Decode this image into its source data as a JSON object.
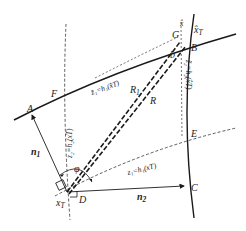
{
  "diagram": {
    "type": "geometric-positioning-diagram",
    "points": {
      "A": "A",
      "B": "B",
      "C": "C",
      "D": "D",
      "E": "E",
      "F": "F",
      "G": "G"
    },
    "vectors": {
      "n1": "n",
      "n1_sub": "1",
      "n2": "n",
      "n2_sub": "2"
    },
    "lengths": {
      "R1": "R",
      "R1_sub": "1",
      "R": "R",
      "b": "b"
    },
    "angle": "φ",
    "states": {
      "xT": "x",
      "xT_sub": "T",
      "xT_hat": "x̂",
      "xT_hat_sub": "T",
      "x_hat": "x̂"
    },
    "curves": {
      "upper_solid": "z̃₁=h₁(x̂T)",
      "right_solid": "z̃₂=h₂(x̂T)",
      "left_dashed": "z₂=h₂(xT)",
      "lower_dashed": "z₁=h₁(xT)"
    },
    "colors": {
      "stroke": "#1a1a1a",
      "dashed": "#333333",
      "background": "#ffffff"
    }
  }
}
